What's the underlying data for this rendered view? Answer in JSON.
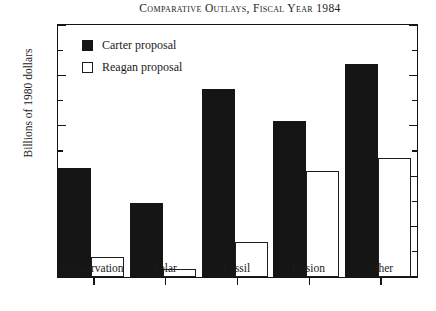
{
  "chart_data": {
    "type": "bar",
    "title": "Comparative Outlays, Fiscal Year 1984",
    "xlabel": "",
    "ylabel": "Billions of 1980 dollars",
    "categories": [
      "Conservation",
      "Solar",
      "Fossil",
      "Fission",
      "Other"
    ],
    "series": [
      {
        "name": "Carter proposal",
        "color": "#151515",
        "fill": "solid",
        "values": [
          0.65,
          0.44,
          1.12,
          0.93,
          1.27
        ]
      },
      {
        "name": "Reagan proposal",
        "color": "#ffffff",
        "fill": "open",
        "values": [
          0.12,
          0.05,
          0.21,
          0.63,
          0.71
        ]
      }
    ],
    "ylim": [
      0,
      1.5
    ],
    "y_major_ticks": [
      0,
      0.3,
      0.6,
      0.9,
      1.2,
      1.5
    ],
    "y_tick_labels": [
      "0",
      "0.3",
      "0.6",
      "0.9",
      "1.2",
      "1.5"
    ],
    "y_minor_ticks": [
      0.15,
      0.45,
      0.75,
      1.05,
      1.35
    ],
    "grid": false,
    "legend_position": "top-left"
  },
  "legend": {
    "entries": [
      {
        "label": "Carter proposal"
      },
      {
        "label": "Reagan proposal"
      }
    ]
  }
}
